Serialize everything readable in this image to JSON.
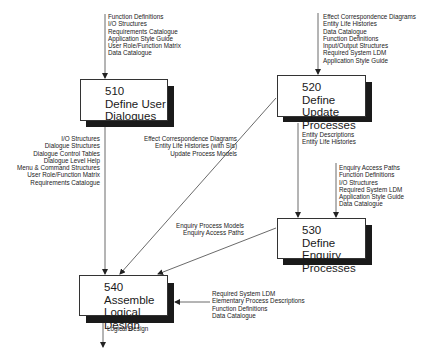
{
  "diagram": {
    "processes": [
      {
        "id": "510",
        "name_line1": "Define User",
        "name_line2": "Dialogues"
      },
      {
        "id": "520",
        "name_line1": "Define Update",
        "name_line2": "Processes"
      },
      {
        "id": "530",
        "name_line1": "Define Enquiry",
        "name_line2": "Processes"
      },
      {
        "id": "540",
        "name_line1": "Assemble",
        "name_line2": "Logical  Design"
      }
    ],
    "flows": {
      "into_510": [
        "Function Definitions",
        "I/O Structures",
        "Requirements Catalogue",
        "Application Style Guide",
        "User Role/Function Matrix",
        "Data Catalogue"
      ],
      "into_520": [
        "Effect Correspondence Diagrams",
        "Entity Life Histories",
        "Data Catalogue",
        "Function Definitions",
        "Input/Output Structures",
        "Required System LDM",
        "Application Style Guide"
      ],
      "510_to_540": [
        "I/O Structures",
        "Dialogue Structures",
        "Dialogue Control Tables",
        "Dialogue Level Help",
        "Menu & Command Structures",
        "User Role/Function Matrix",
        "Requirements Catalogue"
      ],
      "520_to_540": [
        "Effect Correspondence Diagrams",
        "Entity Life Histories (with SIs)",
        "Update Process Models"
      ],
      "520_to_530": [
        "Entity Descriptions",
        "Entity Life Histories"
      ],
      "into_530": [
        "Enquiry Access Paths",
        "Function Definitions",
        "I/O Structures",
        "Required System LDM",
        "Application Style Guide",
        "Data Catalogue"
      ],
      "530_to_540": [
        "Enquiry Process Models",
        "Enquiry Access Paths"
      ],
      "into_540": [
        "Required System LDM",
        "Elementary Process Descriptions",
        "Function Definitions",
        "Data Catalogue"
      ],
      "out_of_540": [
        "Logical Design"
      ]
    }
  }
}
